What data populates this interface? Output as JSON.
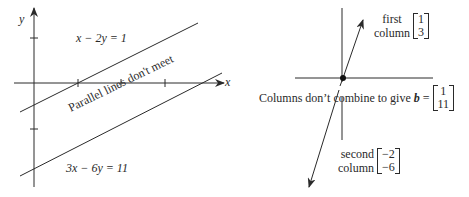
{
  "left_panel": {
    "axis_labels": {
      "x": "x",
      "y": "y"
    },
    "line1_label": "x − 2y = 1",
    "line2_label": "3x − 6y = 11",
    "annotation": "Parallel lines don't meet"
  },
  "right_panel": {
    "first_column": {
      "label_line1": "first",
      "label_line2": "column",
      "vector": [
        "1",
        "3"
      ]
    },
    "second_column": {
      "label_line1": "second",
      "label_line2": "column",
      "vector": [
        "−2",
        "−6"
      ]
    },
    "caption": {
      "text": "Columns don’t combine to give",
      "symbol": "b",
      "equals": "=",
      "vector": [
        "1",
        "11"
      ]
    }
  },
  "colors": {
    "ink": "#2a2a2a",
    "background": "#ffffff"
  }
}
